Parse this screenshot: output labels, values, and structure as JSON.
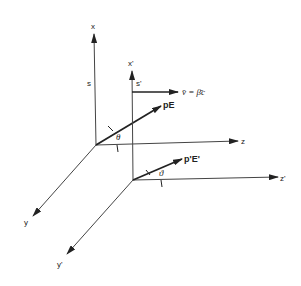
{
  "diagram": {
    "type": "coordinate-frames-3d",
    "frames": [
      {
        "name": "S",
        "frame_label": "s",
        "axes": {
          "x": "x",
          "y": "y",
          "z": "z"
        },
        "momentum_label": "pE",
        "angle_label": "θ"
      },
      {
        "name": "S'",
        "frame_label": "s'",
        "axes": {
          "x": "x'",
          "y": "y'",
          "z": "z'"
        },
        "momentum_label": "p'E'",
        "angle_label": "ϑ"
      }
    ],
    "velocity_label": "v̄ = β̄c",
    "colors": {
      "line": "#333333",
      "background": "#ffffff"
    }
  }
}
